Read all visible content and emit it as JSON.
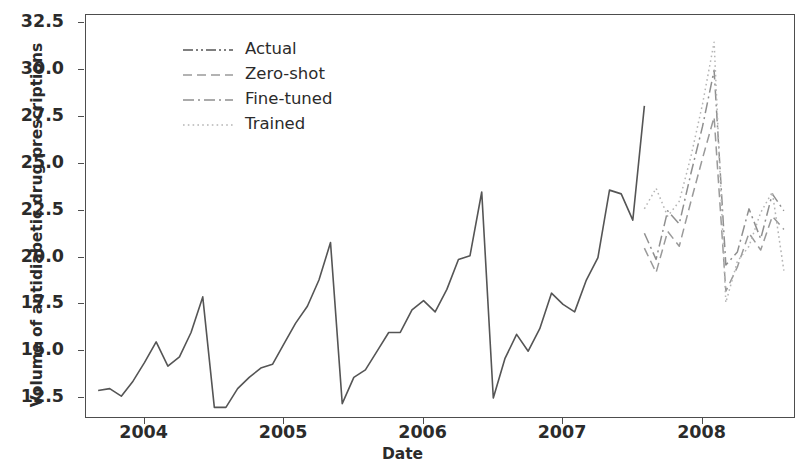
{
  "chart_data": {
    "type": "line",
    "title": "",
    "xlabel": "Date",
    "ylabel": "Volume of antidiabetic drug prescriptions",
    "grid": false,
    "legend_position": "upper left",
    "xlim": [
      2003.58,
      2008.67
    ],
    "ylim": [
      11.38,
      32.95
    ],
    "y_ticks": [
      12.5,
      15.0,
      17.5,
      20.0,
      22.5,
      25.0,
      27.5,
      30.0,
      32.5
    ],
    "y_tick_labels": [
      "12.5",
      "15.0",
      "17.5",
      "20.0",
      "22.5",
      "25.0",
      "27.5",
      "30.0",
      "32.5"
    ],
    "x_ticks": [
      2004,
      2005,
      2006,
      2007,
      2008
    ],
    "x_tick_labels": [
      "2004",
      "2005",
      "2006",
      "2007",
      "2008"
    ],
    "series": [
      {
        "name": "Actual",
        "linestyle": "dashdotdotted",
        "color": "#555555",
        "x": [
          2003.667,
          2003.75,
          2003.833,
          2003.917,
          2004.0,
          2004.083,
          2004.167,
          2004.25,
          2004.333,
          2004.417,
          2004.5,
          2004.583,
          2004.667,
          2004.75,
          2004.833,
          2004.917,
          2005.0,
          2005.083,
          2005.167,
          2005.25,
          2005.333,
          2005.417,
          2005.5,
          2005.583,
          2005.667,
          2005.75,
          2005.833,
          2005.917,
          2006.0,
          2006.083,
          2006.167,
          2006.25,
          2006.333,
          2006.417,
          2006.5,
          2006.583,
          2006.667,
          2006.75,
          2006.833,
          2006.917,
          2007.0,
          2007.083,
          2007.167,
          2007.25,
          2007.333,
          2007.417,
          2007.5,
          2007.583
        ],
        "values": [
          12.9,
          13.0,
          12.6,
          13.4,
          14.4,
          15.5,
          14.2,
          14.7,
          16.0,
          17.9,
          12.0,
          12.0,
          13.0,
          13.6,
          14.1,
          14.3,
          15.4,
          16.5,
          17.4,
          18.8,
          20.8,
          12.2,
          13.6,
          14.0,
          15.0,
          16.0,
          16.0,
          17.2,
          17.7,
          17.1,
          18.3,
          19.9,
          20.1,
          23.5,
          12.5,
          14.6,
          15.9,
          15.0,
          16.2,
          18.1,
          17.5,
          17.1,
          18.8,
          20.0,
          23.6,
          23.4,
          22.0,
          28.1
        ],
        "segments_note": "solid dark gray observed series through mid-2007"
      },
      {
        "name": "Zero-shot",
        "linestyle": "dashed",
        "color": "#9a9a9a",
        "x": [
          2007.583,
          2007.667,
          2007.75,
          2007.833,
          2007.917,
          2008.0,
          2008.083,
          2008.167,
          2008.25,
          2008.333,
          2008.417,
          2008.5,
          2008.583
        ],
        "values": [
          20.5,
          19.2,
          21.4,
          20.6,
          23.0,
          25.3,
          27.5,
          18.2,
          19.5,
          21.3,
          20.4,
          22.2,
          21.5
        ]
      },
      {
        "name": "Fine-tuned",
        "linestyle": "dashdot",
        "color": "#8f8f8f",
        "x": [
          2007.583,
          2007.667,
          2007.75,
          2007.833,
          2007.917,
          2008.0,
          2008.083,
          2008.167,
          2008.25,
          2008.333,
          2008.417,
          2008.5,
          2008.583
        ],
        "values": [
          21.3,
          19.9,
          22.5,
          21.8,
          24.5,
          27.0,
          30.0,
          19.6,
          20.3,
          22.6,
          21.0,
          23.4,
          22.5
        ]
      },
      {
        "name": "Trained",
        "linestyle": "dotted",
        "color": "#b5b5b5",
        "x": [
          2007.583,
          2007.667,
          2007.75,
          2007.833,
          2007.917,
          2008.0,
          2008.083,
          2008.167,
          2008.25,
          2008.333,
          2008.417,
          2008.5,
          2008.583
        ],
        "values": [
          22.6,
          23.7,
          22.2,
          23.0,
          25.4,
          28.2,
          31.5,
          17.6,
          19.8,
          20.6,
          22.4,
          23.5,
          19.3
        ]
      }
    ],
    "forecast_start": 2007.583
  },
  "legend": {
    "items": [
      {
        "label": "Actual",
        "style": "dashdotdotted",
        "color": "#555555"
      },
      {
        "label": "Zero-shot",
        "style": "dashed",
        "color": "#9a9a9a"
      },
      {
        "label": "Fine-tuned",
        "style": "dashdot",
        "color": "#8f8f8f"
      },
      {
        "label": "Trained",
        "style": "dotted",
        "color": "#b5b5b5"
      }
    ]
  },
  "axes": {
    "y_title": "Volume of antidiabetic drug prescriptions",
    "x_title": "Date",
    "y_tick_labels": [
      "32.5",
      "30.0",
      "27.5",
      "25.0",
      "22.5",
      "20.0",
      "17.5",
      "15.0",
      "12.5"
    ],
    "x_tick_labels": [
      "2004",
      "2005",
      "2006",
      "2007",
      "2008"
    ]
  },
  "colors": {
    "axis": "#4d4d4d",
    "text": "#2b2b2b",
    "actual": "#555555",
    "zero_shot": "#9a9a9a",
    "fine_tuned": "#8f8f8f",
    "trained": "#b5b5b5",
    "background": "#ffffff"
  }
}
